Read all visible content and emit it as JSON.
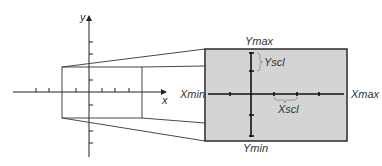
{
  "diagram": {
    "coordinate_plane": {
      "x_axis_label": "x",
      "y_axis_label": "y"
    },
    "screen": {
      "fill_color": "#d4d4d4",
      "border_color": "#333333",
      "labels": {
        "xmin": "Xmin",
        "xmax": "Xmax",
        "ymin": "Ymin",
        "ymax": "Ymax",
        "xscl": "Xscl",
        "yscl": "Yscl"
      }
    }
  }
}
